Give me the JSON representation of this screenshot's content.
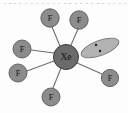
{
  "figure": {
    "name": "xef6-lone-pair-structure",
    "type": "molecular-structure-diagram",
    "background_color": "#fdfdfd"
  },
  "central_atom": {
    "symbol": "Xe",
    "cx": 66,
    "cy": 57,
    "r": 12.5,
    "fill": "#6b6b6b",
    "stroke": "#3a3a3a",
    "font_size": 9.5,
    "text_color": "#111111"
  },
  "ligands": [
    {
      "symbol": "F",
      "cx": 50,
      "cy": 18,
      "r": 9.2,
      "fill": "#8c8c8c",
      "stroke": "#5a5a5a",
      "font_size": 8.5
    },
    {
      "symbol": "F",
      "cx": 79,
      "cy": 20,
      "r": 9.2,
      "fill": "#8c8c8c",
      "stroke": "#5a5a5a",
      "font_size": 8.5
    },
    {
      "symbol": "F",
      "cx": 22,
      "cy": 49,
      "r": 9.0,
      "fill": "#8c8c8c",
      "stroke": "#5a5a5a",
      "font_size": 8.5
    },
    {
      "symbol": "F",
      "cx": 18,
      "cy": 73,
      "r": 9.0,
      "fill": "#8c8c8c",
      "stroke": "#5a5a5a",
      "font_size": 8.5
    },
    {
      "symbol": "F",
      "cx": 51,
      "cy": 97,
      "r": 9.0,
      "fill": "#8c8c8c",
      "stroke": "#5a5a5a",
      "font_size": 8.5
    },
    {
      "symbol": "F",
      "cx": 110,
      "cy": 78,
      "r": 8.6,
      "fill": "#8c8c8c",
      "stroke": "#5a5a5a",
      "font_size": 8.2
    }
  ],
  "bonds": [
    {
      "from": "Xe",
      "to": "F-top-left",
      "x1": 60,
      "y1": 46,
      "x2": 52,
      "y2": 27
    },
    {
      "from": "Xe",
      "to": "F-top-right",
      "x1": 71,
      "y1": 45,
      "x2": 78,
      "y2": 29
    },
    {
      "from": "Xe",
      "to": "F-mid-left",
      "x1": 54,
      "y1": 53,
      "x2": 31,
      "y2": 50
    },
    {
      "from": "Xe",
      "to": "F-lower-left",
      "x1": 54,
      "y1": 61,
      "x2": 27,
      "y2": 71
    },
    {
      "from": "Xe",
      "to": "F-bottom",
      "x1": 61,
      "y1": 68,
      "x2": 53,
      "y2": 88
    },
    {
      "from": "Xe",
      "to": "F-right",
      "x1": 77,
      "y1": 63,
      "x2": 102,
      "y2": 74
    }
  ],
  "lone_pair": {
    "name": "lone-pair-lobe",
    "cx": 100,
    "cy": 48,
    "rx": 20,
    "ry": 7.5,
    "rotation_deg": -20,
    "fill": "#b3b3b3",
    "stroke": "#6f6f6f",
    "electron_dots": [
      {
        "cx": 96,
        "cy": 45,
        "r": 1.2,
        "fill": "#1a1a1a"
      },
      {
        "cx": 100,
        "cy": 51,
        "r": 1.2,
        "fill": "#1a1a1a"
      }
    ]
  },
  "scan_artifacts": {
    "description": "faint dotted scan line along top edge",
    "y": 3,
    "color": "#cfcfcf",
    "dot_xs": [
      4,
      9,
      14,
      19,
      25,
      31,
      36,
      42,
      47,
      53,
      58,
      64,
      69,
      75,
      80,
      86,
      91,
      97,
      102,
      108,
      113,
      119,
      124
    ]
  }
}
